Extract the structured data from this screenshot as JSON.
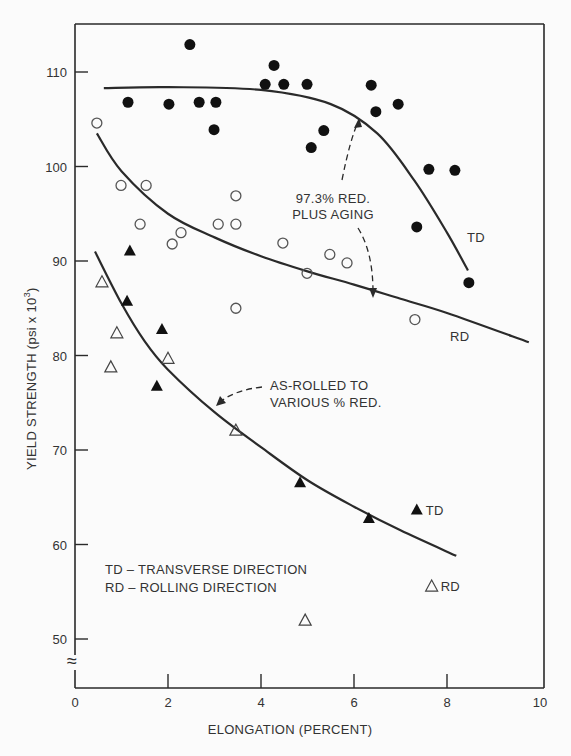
{
  "chart_data": {
    "type": "scatter",
    "title": "",
    "xlabel": "ELONGATION (PERCENT)",
    "ylabel": "YIELD STRENGTH (psi x 10^3)",
    "xlim": [
      0,
      10
    ],
    "ylim": [
      46,
      115
    ],
    "x_ticks": [
      0,
      2,
      4,
      6,
      8,
      10
    ],
    "y_ticks": [
      50,
      60,
      70,
      80,
      90,
      100,
      110
    ],
    "axis_break": "≈",
    "grid": false,
    "series": [
      {
        "name": "97.3% RED. PLUS AGING - TD",
        "marker": "filled-circle",
        "points": [
          [
            1.14,
            106.8
          ],
          [
            2.02,
            106.6
          ],
          [
            2.47,
            112.9
          ],
          [
            2.67,
            106.8
          ],
          [
            3.03,
            106.8
          ],
          [
            2.99,
            103.9
          ],
          [
            4.09,
            108.7
          ],
          [
            4.28,
            110.7
          ],
          [
            4.49,
            108.7
          ],
          [
            4.99,
            108.7
          ],
          [
            5.35,
            103.8
          ],
          [
            5.08,
            102.0
          ],
          [
            6.37,
            108.6
          ],
          [
            6.47,
            105.8
          ],
          [
            6.95,
            106.6
          ],
          [
            7.61,
            99.7
          ],
          [
            8.17,
            99.6
          ],
          [
            7.35,
            93.6
          ],
          [
            8.47,
            87.7
          ]
        ]
      },
      {
        "name": "97.3% RED. PLUS AGING - RD",
        "marker": "open-circle",
        "points": [
          [
            0.47,
            104.6
          ],
          [
            0.99,
            98.0
          ],
          [
            1.53,
            98.0
          ],
          [
            1.4,
            93.9
          ],
          [
            2.09,
            91.8
          ],
          [
            2.28,
            93.0
          ],
          [
            3.08,
            93.9
          ],
          [
            3.46,
            96.9
          ],
          [
            3.46,
            93.9
          ],
          [
            3.46,
            85.0
          ],
          [
            4.47,
            91.9
          ],
          [
            4.99,
            88.7
          ],
          [
            5.48,
            90.7
          ],
          [
            5.85,
            89.8
          ],
          [
            7.31,
            83.8
          ]
        ]
      },
      {
        "name": "AS-ROLLED - TD",
        "marker": "filled-triangle",
        "points": [
          [
            1.18,
            91.1
          ],
          [
            1.12,
            85.8
          ],
          [
            1.87,
            82.8
          ],
          [
            1.76,
            76.8
          ],
          [
            4.84,
            66.6
          ],
          [
            6.32,
            62.8
          ]
        ]
      },
      {
        "name": "AS-ROLLED - RD",
        "marker": "open-triangle",
        "points": [
          [
            0.58,
            87.8
          ],
          [
            0.9,
            82.4
          ],
          [
            0.77,
            78.8
          ],
          [
            2.0,
            79.7
          ],
          [
            3.46,
            72.1
          ],
          [
            4.95,
            52.0
          ]
        ]
      }
    ],
    "curves": [
      {
        "name": "TD (aged)",
        "points": [
          [
            0.62,
            108.3
          ],
          [
            2,
            108.4
          ],
          [
            4,
            108.1
          ],
          [
            5.5,
            106.6
          ],
          [
            6.5,
            103.5
          ],
          [
            7.3,
            98.5
          ],
          [
            8.0,
            93
          ],
          [
            8.45,
            89
          ]
        ],
        "label": "TD"
      },
      {
        "name": "RD (aged)",
        "points": [
          [
            0.47,
            103.5
          ],
          [
            1,
            99.5
          ],
          [
            2,
            95
          ],
          [
            3,
            92.5
          ],
          [
            4,
            90.5
          ],
          [
            5,
            88.9
          ],
          [
            6,
            87.5
          ],
          [
            7,
            86
          ],
          [
            8,
            84.5
          ],
          [
            9.76,
            81.4
          ]
        ],
        "label": "RD"
      },
      {
        "name": "As-rolled",
        "points": [
          [
            0.43,
            91.0
          ],
          [
            1,
            85.5
          ],
          [
            1.5,
            81.5
          ],
          [
            2,
            78.5
          ],
          [
            3,
            74
          ],
          [
            4,
            70.3
          ],
          [
            5,
            66.8
          ],
          [
            6,
            64
          ],
          [
            7,
            61.5
          ],
          [
            8.2,
            58.8
          ]
        ]
      }
    ],
    "annotations": [
      {
        "text_lines": [
          "97.3% RED.",
          "PLUS AGING"
        ],
        "x": 5.9,
        "y": 95.5
      },
      {
        "text_lines": [
          "AS-ROLLED TO",
          "VARIOUS % RED."
        ],
        "x": 4.3,
        "y": 77.0
      }
    ],
    "legend_markers": [
      {
        "marker": "filled-triangle",
        "label": "TD",
        "x": 7.35,
        "y": 63.7
      },
      {
        "marker": "open-triangle",
        "label": "RD",
        "x": 7.67,
        "y": 55.6
      }
    ],
    "legend_text": [
      "TD – TRANSVERSE DIRECTION",
      "RD – ROLLING DIRECTION"
    ]
  },
  "labels": {
    "ylabel_main": "YIELD STRENGTH (psi x 10",
    "ylabel_sup": "3",
    "ylabel_end": ")"
  }
}
